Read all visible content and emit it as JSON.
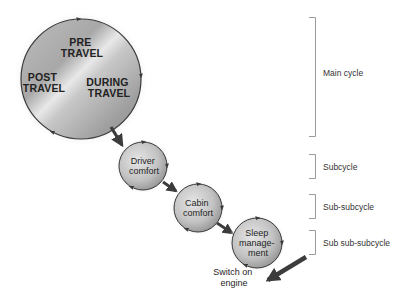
{
  "diagram": {
    "main_cycle": {
      "phases": [
        {
          "line1": "PRE",
          "line2": "TRAVEL"
        },
        {
          "line1": "POST",
          "line2": "TRAVEL"
        },
        {
          "line1": "DURING",
          "line2": "TRAVEL"
        }
      ]
    },
    "sub_circles": [
      {
        "line1": "Driver",
        "line2": "comfort"
      },
      {
        "line1": "Cabin",
        "line2": "comfort"
      },
      {
        "line1": "Sleep",
        "line2": "manage-",
        "line3": "ment"
      }
    ],
    "exit": {
      "line1": "Switch on",
      "line2": "engine"
    },
    "levels": [
      {
        "label": "Main cycle"
      },
      {
        "label": "Subcycle"
      },
      {
        "label": "Sub-subcycle"
      },
      {
        "label": "Sub sub-subcycle"
      }
    ],
    "colors": {
      "circle_light": "#e4e4e4",
      "circle_dark": "#8a8a8a",
      "outline": "#3a3a3a",
      "arrow": "#3c3c3c",
      "bracket": "#9a9a9a"
    }
  }
}
